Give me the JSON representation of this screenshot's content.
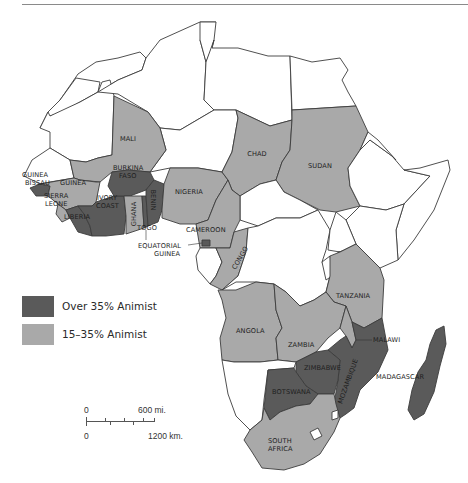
{
  "map": {
    "title": "Animist population in Africa",
    "colors": {
      "over35": "#5a5a5a",
      "range15to35": "#a9a9a9",
      "none": "#ffffff",
      "border": "#3c3c3c",
      "uganda_patch": "#d7d7d7"
    },
    "labels": {
      "mali": "MALI",
      "chad": "CHAD",
      "sudan": "SUDAN",
      "guinea_bissau_1": "GUINEA",
      "guinea_bissau_2": "BISSAU",
      "guinea": "GUINEA",
      "sierra_leone_1": "SIERRA",
      "sierra_leone_2": "LEONE",
      "liberia": "LIBERIA",
      "ivory_coast_1": "IVORY",
      "ivory_coast_2": "COAST",
      "burkina_faso_1": "BURKINA",
      "burkina_faso_2": "FASO",
      "ghana": "GHANA",
      "benin": "BENIN",
      "togo": "TOGO",
      "nigeria": "NIGERIA",
      "cameroon": "CAMEROON",
      "equatorial_guinea_1": "EQUATORIAL",
      "equatorial_guinea_2": "GUINEA",
      "congo": "CONGO",
      "tanzania": "TANZANIA",
      "angola": "ANGOLA",
      "zambia": "ZAMBIA",
      "malawi": "MALAWI",
      "zimbabwe": "ZIMBABWE",
      "mozambique": "MOZAMBIQUE",
      "botswana": "BOTSWANA",
      "madagascar": "MADAGASCAR",
      "south_africa_1": "SOUTH",
      "south_africa_2": "AFRICA"
    },
    "countries": {
      "over_35_animist": [
        "Guinea-Bissau",
        "Liberia",
        "Ivory Coast",
        "Burkina Faso",
        "Benin",
        "Togo",
        "Equatorial Guinea",
        "Malawi",
        "Zimbabwe",
        "Mozambique",
        "Botswana",
        "Madagascar"
      ],
      "from_15_to_35_animist": [
        "Mali",
        "Chad",
        "Sudan",
        "Guinea",
        "Sierra Leone",
        "Ghana",
        "Nigeria",
        "Cameroon",
        "Congo",
        "Tanzania",
        "Angola",
        "Zambia",
        "South Africa"
      ]
    }
  },
  "legend": {
    "items": [
      {
        "label": "Over 35% Animist",
        "color": "#5a5a5a"
      },
      {
        "label": "15–35% Animist",
        "color": "#a9a9a9"
      }
    ]
  },
  "scale": {
    "miles_zero": "0",
    "miles_max": "600 mi.",
    "km_zero": "0",
    "km_max": "1200 km."
  }
}
